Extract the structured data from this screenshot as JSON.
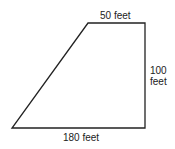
{
  "diagram": {
    "shape": "trapezoid",
    "labels": {
      "top": "50 feet",
      "right_line1": "100",
      "right_line2": "feet",
      "bottom": "180 feet"
    },
    "stroke_color": "#222222"
  }
}
